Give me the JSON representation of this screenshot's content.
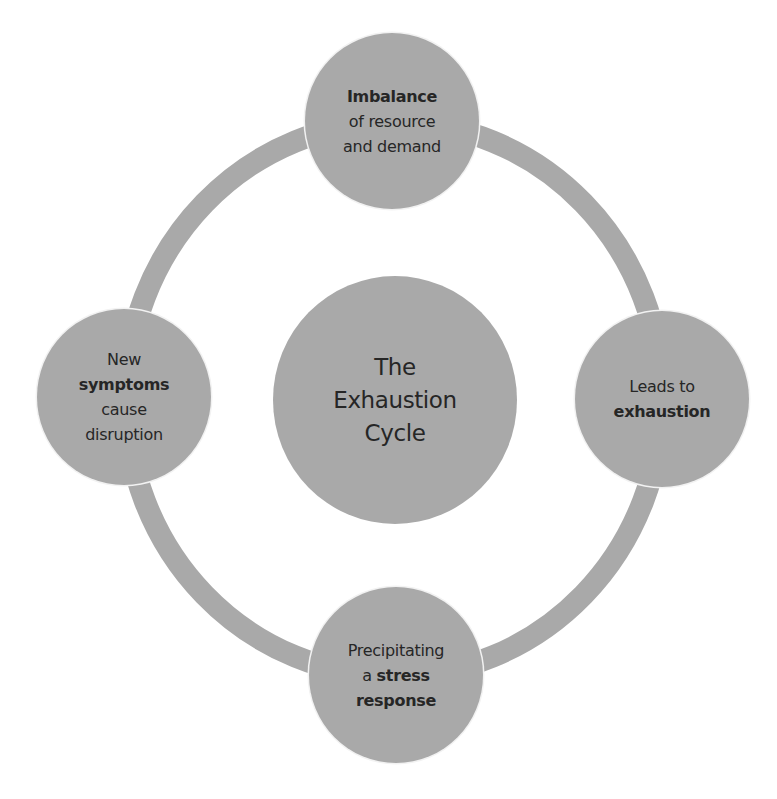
{
  "diagram": {
    "type": "cycle",
    "colors": {
      "node_fill": "#a9a9a9",
      "ring_stroke": "#a9a9a9",
      "text": "#262626",
      "background": "#ffffff"
    },
    "center": {
      "lines": [
        "The",
        "Exhaustion",
        "Cycle"
      ]
    },
    "nodes": {
      "top": {
        "position": "top",
        "lines": [
          {
            "text": "Imbalance",
            "bold": true
          },
          {
            "text": "of resource",
            "bold": false
          },
          {
            "text": "and demand",
            "bold": false
          }
        ]
      },
      "right": {
        "position": "right",
        "lines": [
          {
            "text": "Leads to",
            "bold": false
          },
          {
            "text": "exhaustion",
            "bold": true
          }
        ]
      },
      "bottom": {
        "position": "bottom",
        "lines": [
          {
            "text": "Precipitating",
            "bold": false
          },
          {
            "pre": "a ",
            "text": "stress",
            "bold": true
          },
          {
            "text": "response",
            "bold": true
          }
        ]
      },
      "left": {
        "position": "left",
        "lines": [
          {
            "text": "New",
            "bold": false
          },
          {
            "text": "symptoms",
            "bold": true
          },
          {
            "text": "cause",
            "bold": false
          },
          {
            "text": "disruption",
            "bold": false
          }
        ]
      }
    },
    "sequence": [
      "top",
      "right",
      "bottom",
      "left"
    ]
  }
}
